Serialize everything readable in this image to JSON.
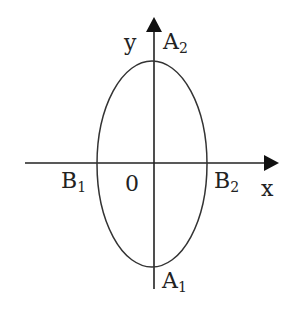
{
  "diagram": {
    "type": "ellipse-on-axes",
    "colors": {
      "stroke": "#222222",
      "background": "#ffffff"
    },
    "axes": {
      "x_label": "x",
      "y_label": "y",
      "origin_label": "0"
    },
    "points": {
      "A2": {
        "base": "A",
        "sub": "2"
      },
      "A1": {
        "base": "A",
        "sub": "1"
      },
      "B1": {
        "base": "B",
        "sub": "1"
      },
      "B2": {
        "base": "B",
        "sub": "2"
      }
    },
    "ellipse": {
      "cx": 154,
      "cy": 163,
      "rx": 54,
      "ry": 103
    }
  }
}
